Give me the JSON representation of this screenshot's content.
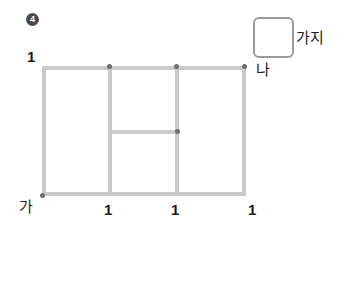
{
  "problem": {
    "number_badge": "4",
    "badge_shape": "filled-circle",
    "badge_color": "#4a4a4a"
  },
  "figure": {
    "type": "grid-polygon",
    "line_color": "#c9c9c9",
    "dot_color": "#6e6e6e",
    "outer_rect": {
      "x": 42,
      "y": 66,
      "width": 204,
      "height": 130
    },
    "vertical_lines": [
      110,
      177
    ],
    "horizontal_inner_line": {
      "x1": 110,
      "x2": 180,
      "y": 131
    },
    "vertices": [
      {
        "name": "top-v1",
        "x": 110,
        "y": 66
      },
      {
        "name": "top-v2",
        "x": 177,
        "y": 66
      },
      {
        "name": "top-right-na",
        "x": 245,
        "y": 66
      },
      {
        "name": "mid-junction",
        "x": 177,
        "y": 131
      },
      {
        "name": "bottom-left-ga",
        "x": 42,
        "y": 195
      }
    ]
  },
  "labels": {
    "left_length": "1",
    "point_ga": "가",
    "point_na": "나",
    "bottom_lengths": [
      "1",
      "1",
      "1"
    ]
  },
  "answer": {
    "box_value": "",
    "box_placeholder": "",
    "unit_label": "가지"
  }
}
